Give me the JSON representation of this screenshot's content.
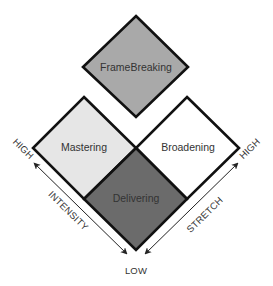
{
  "diagram": {
    "quadrants": [
      {
        "label": "FrameBreaking",
        "fill": "#a9a9a9"
      },
      {
        "label": "Mastering",
        "fill": "#e6e6e6"
      },
      {
        "label": "Broadening",
        "fill": "#ffffff"
      },
      {
        "label": "Delivering",
        "fill": "#6b6b6b"
      }
    ],
    "axes": {
      "intensity": {
        "label": "INTENSITY",
        "high": "HIGH"
      },
      "stretch": {
        "label": "STRETCH",
        "high": "HIGH"
      },
      "low": "LOW"
    },
    "colors": {
      "stroke": "#111111",
      "text": "#333333"
    }
  }
}
